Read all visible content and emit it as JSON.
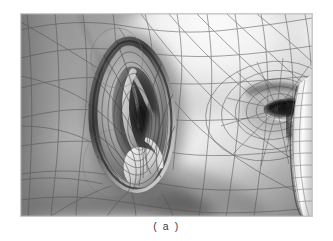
{
  "figure": {
    "caption": "( a )",
    "colors": {
      "page_background": "#ffffff",
      "plate_border": "#c9c9c9",
      "skin_mid": "#8e8e8e",
      "skin_highlight": "#f4f4f4",
      "skin_shadow": "#4a4a4a",
      "wireframe_line": "#4d4d4d",
      "ear_canal_dark": "#1d1d1d",
      "eye_socket_dark": "#141414",
      "caption_text": "#3a3a3a"
    },
    "regions": [
      {
        "name": "temple-highlight",
        "tone": "bright"
      },
      {
        "name": "ear-helix-rim",
        "tone": "mid"
      },
      {
        "name": "ear-concha-cavity",
        "tone": "dark"
      },
      {
        "name": "ear-lobe",
        "tone": "mid-bright"
      },
      {
        "name": "cheek-jaw-shadow",
        "tone": "dark"
      },
      {
        "name": "eye-socket",
        "tone": "dark"
      },
      {
        "name": "nose-bridge-highlight",
        "tone": "bright"
      },
      {
        "name": "sideburn-hairline",
        "tone": "mid"
      }
    ],
    "mesh": {
      "type": "quad-polygon-wireframe",
      "visible": true,
      "line_opacity": 0.55
    }
  }
}
